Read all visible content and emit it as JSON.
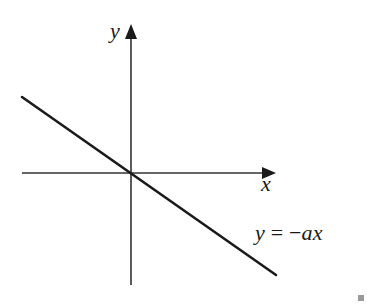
{
  "diagram": {
    "axes": {
      "x_label": "x",
      "y_label": "y",
      "origin_px": [
        131,
        173
      ],
      "x_axis_px": {
        "x1": 22,
        "x2": 276,
        "y": 173
      },
      "y_axis_px": {
        "x": 131,
        "y1": 24,
        "y2": 285
      },
      "color": "#333333"
    },
    "line": {
      "equation_label": "y = −ax",
      "equation_parts": {
        "lhs": "y",
        "eq": "=",
        "rhs_sign": "−",
        "rhs": "ax"
      },
      "slope_sign": "negative",
      "passes_through_origin": true,
      "endpoints_px": [
        [
          22,
          97
        ],
        [
          276,
          275
        ]
      ],
      "color": "#1a1a1a"
    },
    "corner_mark_color": "#9a9a9a"
  }
}
